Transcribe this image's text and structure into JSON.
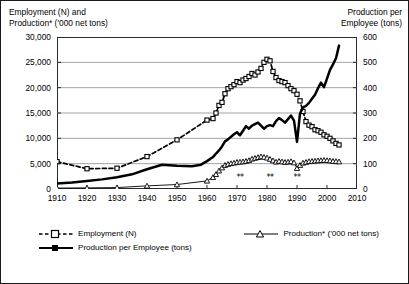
{
  "axis_titles": {
    "left": "Employment (N) and\nProduction* ('000 net tons)",
    "right": "Production per\nEmployee (tons)"
  },
  "left_ticks": [
    "30,000",
    "25,000",
    "20,000",
    "15,000",
    "10,000",
    "5,000",
    "0"
  ],
  "right_ticks": [
    "600",
    "500",
    "400",
    "300",
    "200",
    "100",
    "0"
  ],
  "x_ticks": [
    "1910",
    "1920",
    "1930",
    "1940",
    "1950",
    "1960",
    "1970",
    "1980",
    "1990",
    "2000",
    "2010"
  ],
  "annotations": [
    {
      "text": "**",
      "year": 1971
    },
    {
      "text": "**",
      "year": 1981
    },
    {
      "text": "**",
      "year": 1990
    }
  ],
  "legend": {
    "employment": "Employment (N)",
    "production": "Production* ('000 net tons)",
    "production_per_employee": "Production per Employee (tons)"
  },
  "chart_data": {
    "type": "line",
    "title": "",
    "subtitle": "",
    "xlabel": "",
    "ylabel": "Employment (N) and Production* ('000 net tons)",
    "ylabel_secondary": "Production per Employee (tons)",
    "xlim": [
      1910,
      2010
    ],
    "ylim": [
      0,
      30000
    ],
    "ylim_secondary": [
      0,
      600
    ],
    "grid": true,
    "legend_position": "below",
    "annotations": [
      {
        "text": "**",
        "x": 1971,
        "y": 1200
      },
      {
        "text": "**",
        "x": 1981,
        "y": 1200
      },
      {
        "text": "**",
        "x": 1990,
        "y": 1200
      }
    ],
    "series": [
      {
        "name": "Employment (N)",
        "axis": "left",
        "style": "dashed",
        "marker": "open-square",
        "x": [
          1910,
          1920,
          1930,
          1940,
          1950,
          1960,
          1962,
          1963,
          1964,
          1965,
          1966,
          1967,
          1968,
          1969,
          1970,
          1971,
          1972,
          1973,
          1974,
          1975,
          1976,
          1977,
          1978,
          1979,
          1980,
          1981,
          1982,
          1983,
          1984,
          1985,
          1986,
          1987,
          1988,
          1989,
          1990,
          1991,
          1992,
          1993,
          1994,
          1995,
          1996,
          1997,
          1998,
          1999,
          2000,
          2001,
          2002,
          2003,
          2004
        ],
        "values": [
          5400,
          4000,
          4100,
          6400,
          9700,
          13600,
          13900,
          15000,
          16500,
          17100,
          18800,
          19800,
          20200,
          20600,
          21200,
          21000,
          21500,
          21800,
          22200,
          22800,
          22500,
          23100,
          23800,
          25000,
          25600,
          25300,
          23200,
          22000,
          21400,
          21200,
          21000,
          20400,
          19800,
          19400,
          18700,
          17400,
          15300,
          13300,
          12600,
          12300,
          11700,
          11500,
          11200,
          10700,
          10400,
          10000,
          9500,
          9000,
          8700
        ]
      },
      {
        "name": "Production* ('000 net tons)",
        "axis": "left",
        "style": "solid-thin",
        "marker": "open-triangle",
        "x": [
          1910,
          1920,
          1930,
          1940,
          1950,
          1960,
          1962,
          1963,
          1964,
          1965,
          1966,
          1967,
          1968,
          1969,
          1970,
          1971,
          1972,
          1973,
          1974,
          1975,
          1976,
          1977,
          1978,
          1979,
          1980,
          1981,
          1982,
          1983,
          1984,
          1985,
          1986,
          1987,
          1988,
          1989,
          1990,
          1991,
          1992,
          1993,
          1994,
          1995,
          1996,
          1997,
          1998,
          1999,
          2000,
          2001,
          2002,
          2003,
          2004
        ],
        "values": [
          180,
          220,
          280,
          620,
          880,
          1600,
          2300,
          2900,
          3600,
          4200,
          4700,
          4900,
          5050,
          5150,
          5300,
          5350,
          5400,
          5500,
          5650,
          5950,
          6100,
          6250,
          6400,
          6300,
          6150,
          5900,
          5600,
          5350,
          5500,
          5400,
          5300,
          5350,
          5450,
          5200,
          4100,
          4700,
          5150,
          5300,
          5450,
          5500,
          5550,
          5600,
          5650,
          5700,
          5650,
          5600,
          5500,
          5450,
          5400
        ]
      },
      {
        "name": "Production per Employee (tons)",
        "axis": "right",
        "style": "solid-thick",
        "marker": "filled-square",
        "x": [
          1910,
          1915,
          1920,
          1925,
          1930,
          1935,
          1940,
          1945,
          1950,
          1955,
          1958,
          1960,
          1962,
          1963,
          1964,
          1965,
          1966,
          1967,
          1968,
          1969,
          1970,
          1971,
          1972,
          1973,
          1974,
          1975,
          1976,
          1977,
          1978,
          1979,
          1980,
          1981,
          1982,
          1983,
          1984,
          1985,
          1986,
          1987,
          1988,
          1989,
          1990,
          1991,
          1992,
          1993,
          1994,
          1995,
          1996,
          1997,
          1998,
          1999,
          2000,
          2001,
          2002,
          2003,
          2004
        ],
        "values": [
          22,
          26,
          32,
          38,
          46,
          58,
          78,
          96,
          92,
          90,
          96,
          110,
          126,
          140,
          152,
          168,
          188,
          196,
          206,
          216,
          224,
          212,
          230,
          248,
          238,
          250,
          256,
          262,
          250,
          238,
          248,
          252,
          248,
          268,
          280,
          272,
          262,
          276,
          290,
          270,
          186,
          298,
          322,
          328,
          340,
          356,
          372,
          398,
          420,
          402,
          436,
          470,
          492,
          516,
          566
        ]
      }
    ]
  }
}
